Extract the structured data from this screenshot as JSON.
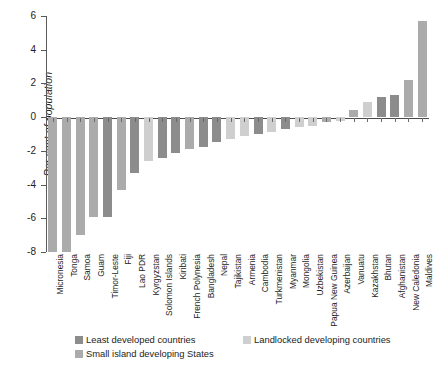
{
  "axes": {
    "ylabel": "Per cent of population",
    "yticks": [
      6,
      4,
      2,
      0,
      -2,
      -4,
      -6,
      -8
    ],
    "ytick_labels": [
      "6",
      "4",
      "2",
      "0",
      "-2",
      "-4",
      "-6",
      "-8"
    ],
    "ylim": [
      -8,
      6
    ],
    "grid": false
  },
  "legend": {
    "position": "bottom",
    "items": [
      {
        "label": "Least developed countries",
        "color": "#8c8c8c"
      },
      {
        "label": "Landlocked developing countries",
        "color": "#cfcfcf"
      },
      {
        "label": "Small island developing States",
        "color": "#ababab"
      }
    ]
  },
  "colors": {
    "least_developed": "#8c8c8c",
    "landlocked_developing": "#cfcfcf",
    "small_island_developing": "#ababab",
    "axis": "#5a5a5a",
    "text": "#1d1d1d",
    "background": "#ffffff"
  },
  "chart_data": {
    "type": "bar",
    "title": "",
    "subtitle": "",
    "xlabel": "",
    "ylabel": "Per cent of population",
    "ylim": [
      -8,
      6
    ],
    "grid": false,
    "legend_position": "bottom",
    "categories": [
      "Micronesia",
      "Tonga",
      "Samoa",
      "Guam",
      "Timor-Leste",
      "Fiji",
      "Lao PDR",
      "Kyrgyzstan",
      "Solomon Islands",
      "Kiribati",
      "French Polynesia",
      "Bangladesh",
      "Nepal",
      "Tajikistan",
      "Armenia",
      "Cambodia",
      "Turkmenistan",
      "Myanmar",
      "Mongolia",
      "Uzbekistan",
      "Papua New Guinea",
      "Azerbaijan",
      "Vanuatu",
      "Kazakhstan",
      "Bhutan",
      "Afghanistan",
      "New Caledonia",
      "Maldives"
    ],
    "values": [
      -8.0,
      -8.0,
      -7.0,
      -5.9,
      -5.9,
      -4.3,
      -3.3,
      -2.6,
      -2.4,
      -2.1,
      -1.9,
      -1.8,
      -1.5,
      -1.3,
      -1.1,
      -1.0,
      -0.9,
      -0.7,
      -0.6,
      -0.5,
      -0.3,
      -0.2,
      0.4,
      0.9,
      1.2,
      1.3,
      2.2,
      5.7
    ],
    "groups": [
      "small_island_developing",
      "small_island_developing",
      "small_island_developing",
      "small_island_developing",
      "least_developed",
      "small_island_developing",
      "least_developed",
      "landlocked_developing",
      "least_developed",
      "least_developed",
      "small_island_developing",
      "least_developed",
      "least_developed",
      "landlocked_developing",
      "landlocked_developing",
      "least_developed",
      "landlocked_developing",
      "least_developed",
      "landlocked_developing",
      "landlocked_developing",
      "small_island_developing",
      "landlocked_developing",
      "small_island_developing",
      "landlocked_developing",
      "least_developed",
      "least_developed",
      "small_island_developing",
      "small_island_developing"
    ]
  }
}
